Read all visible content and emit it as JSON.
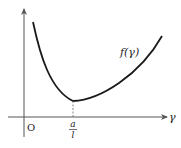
{
  "diagram": {
    "curve_label": "f(γ)",
    "x_axis_label": "γ",
    "origin_label": "O",
    "min_label_numerator": "a",
    "min_label_denominator": "l",
    "colors": {
      "curve": "#1a1a1a",
      "axes": "#555555",
      "dashed": "#777777",
      "text": "#222222"
    }
  }
}
